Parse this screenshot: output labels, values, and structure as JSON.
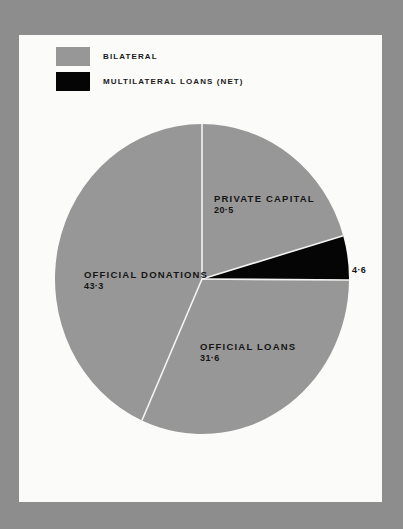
{
  "colors": {
    "background": "#8d8d8d",
    "panel": "#fbfbf9",
    "bilateral": "#979797",
    "multilateral": "#050505",
    "divider": "#f4f4f2"
  },
  "legend": {
    "items": [
      {
        "label": "BILATERAL",
        "color": "#979797"
      },
      {
        "label": "MULTILATERAL LOANS (NET)",
        "color": "#050505"
      }
    ]
  },
  "labels": {
    "private_capital": {
      "name": "PRIVATE CAPITAL",
      "value": "20·5"
    },
    "multilateral": {
      "value": "4·6"
    },
    "official_loans": {
      "name": "OFFICIAL LOANS",
      "value": "31·6"
    },
    "official_donations": {
      "name": "OFFICIAL DONATIONS",
      "value": "43·3"
    }
  },
  "chart_data": {
    "type": "pie",
    "title": "",
    "categories": [
      "Private Capital",
      "Multilateral Loans (Net)",
      "Official Loans",
      "Official Donations"
    ],
    "values": [
      20.5,
      4.6,
      31.6,
      43.3
    ],
    "groups": [
      "Bilateral",
      "Multilateral Loans (Net)",
      "Bilateral",
      "Bilateral"
    ],
    "colors": [
      "#979797",
      "#050505",
      "#979797",
      "#979797"
    ],
    "start_angle": "12 o'clock",
    "direction": "clockwise",
    "legend": {
      "entries": [
        "BILATERAL",
        "MULTILATERAL LOANS (NET)"
      ],
      "position": "top-left"
    },
    "units": "percent of total",
    "decimal_separator": "·"
  }
}
